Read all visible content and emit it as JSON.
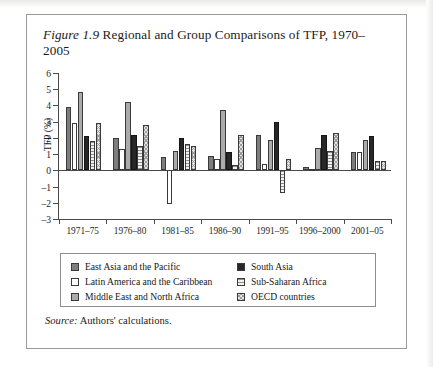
{
  "figure": {
    "label": "Figure 1.9",
    "title": "Regional and Group Comparisons of TFP, 1970–2005",
    "source_label": "Source:",
    "source_text": "Authors' calculations."
  },
  "chart_data": {
    "type": "bar",
    "title": "Figure 1.9 Regional and Group Comparisons of TFP, 1970–2005",
    "xlabel": "",
    "ylabel": "TFP (%)",
    "ylim": [
      -3,
      6
    ],
    "yticks": [
      -3,
      -2,
      -1,
      0,
      1,
      2,
      3,
      4,
      5,
      6
    ],
    "ytick_labels": [
      "–3",
      "–2",
      "–1",
      "0",
      "1",
      "2",
      "3",
      "4",
      "5",
      "6"
    ],
    "grid": false,
    "legend_position": "below",
    "categories": [
      "1971–75",
      "1976–80",
      "1981–85",
      "1986–90",
      "1991–95",
      "1996–2000",
      "2001–05"
    ],
    "series": [
      {
        "name": "East Asia and the Pacific",
        "color": "#7e7e7e",
        "pattern": "solid-dark-gray",
        "values": [
          3.9,
          2.0,
          0.8,
          0.9,
          2.2,
          0.2,
          1.1
        ]
      },
      {
        "name": "Latin America and the Caribbean",
        "color": "#ffffff",
        "pattern": "open-white",
        "values": [
          2.9,
          1.3,
          -2.1,
          0.7,
          0.4,
          0.1,
          1.1
        ]
      },
      {
        "name": "Middle East and North Africa",
        "color": "#ababab",
        "pattern": "solid-medium-gray",
        "values": [
          4.8,
          4.2,
          1.2,
          3.7,
          1.9,
          1.4,
          1.9
        ]
      },
      {
        "name": "South Asia",
        "color": "#272727",
        "pattern": "solid-black",
        "values": [
          2.1,
          2.2,
          2.0,
          1.1,
          3.0,
          2.2,
          2.1
        ]
      },
      {
        "name": "Sub-Saharan Africa",
        "color": "#ededed",
        "pattern": "horizontal-lines",
        "values": [
          1.8,
          1.5,
          1.6,
          0.3,
          -1.4,
          1.2,
          0.6
        ]
      },
      {
        "name": "OECD countries",
        "color": "#e4e4e4",
        "pattern": "cross-hatch",
        "values": [
          2.9,
          2.8,
          1.5,
          2.2,
          0.7,
          2.3,
          0.6
        ]
      }
    ]
  },
  "legend": {
    "items": [
      {
        "label": "East Asia and the Pacific",
        "swatch_class": "s-eap"
      },
      {
        "label": "South Asia",
        "swatch_class": "s-sa"
      },
      {
        "label": "Latin America and the Caribbean",
        "swatch_class": "s-lac"
      },
      {
        "label": "Sub-Saharan Africa",
        "swatch_class": "s-ssa"
      },
      {
        "label": "Middle East and North Africa",
        "swatch_class": "s-mena"
      },
      {
        "label": "OECD countries",
        "swatch_class": "s-oecd"
      }
    ]
  }
}
